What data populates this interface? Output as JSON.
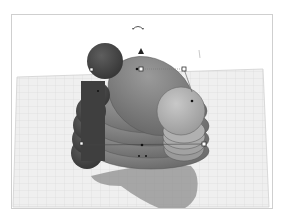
{
  "app": {
    "view": "3D workplane viewport",
    "colors": {
      "background": "#ffffff",
      "frame_border": "#cfcfcf",
      "grid_fill": "#eeeeee",
      "grid_line": "#d4d4d4",
      "shape_dark": "#4a4a4a",
      "shape_mid": "#7a7a7a",
      "shape_light": "#a8a8a8",
      "shadow": "#8e8e8e",
      "handle_fill": "#ffffff",
      "handle_stroke": "#333333"
    }
  },
  "viewport": {
    "workplane": {
      "grid": true
    },
    "selection": {
      "rotate_handle": "rotate-arrow",
      "lift_handle": "cone-up",
      "handles": 5
    },
    "objects": [
      {
        "name": "dark-sphere-stack",
        "count": 5
      },
      {
        "name": "ellipsoid-stack",
        "count": 5
      },
      {
        "name": "light-sphere",
        "count": 1
      }
    ]
  }
}
